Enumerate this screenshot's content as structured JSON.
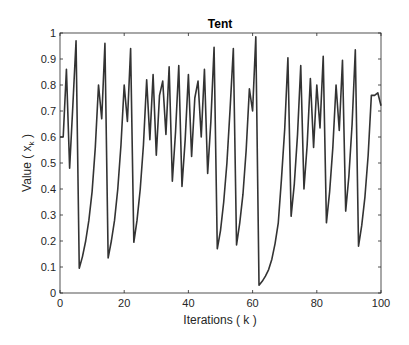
{
  "chart_data": {
    "type": "line",
    "title": "Tent",
    "xlabel": "Iterations ( k )",
    "ylabel_prefix": "Value ( x",
    "ylabel_subscript": "k",
    "ylabel_suffix": " )",
    "xlim": [
      0,
      100
    ],
    "ylim": [
      0,
      1
    ],
    "xticks": [
      0,
      20,
      40,
      60,
      80,
      100
    ],
    "yticks": [
      0,
      0.1,
      0.2,
      0.3,
      0.4,
      0.5,
      0.6,
      0.7,
      0.8,
      0.9,
      1
    ],
    "xtick_labels": [
      "0",
      "20",
      "40",
      "60",
      "80",
      "100"
    ],
    "ytick_labels": [
      "0",
      "0.1",
      "0.2",
      "0.3",
      "0.4",
      "0.5",
      "0.6",
      "0.7",
      "0.8",
      "0.9",
      "1"
    ],
    "grid": false,
    "legend": null,
    "line_color": "#333333",
    "series": [
      {
        "name": "Tent",
        "x": [
          0,
          1,
          2,
          3,
          4,
          5,
          6,
          7,
          8,
          9,
          10,
          11,
          12,
          13,
          14,
          15,
          16,
          17,
          18,
          19,
          20,
          21,
          22,
          23,
          24,
          25,
          26,
          27,
          28,
          29,
          30,
          31,
          32,
          33,
          34,
          35,
          36,
          37,
          38,
          39,
          40,
          41,
          42,
          43,
          44,
          45,
          46,
          47,
          48,
          49,
          50,
          51,
          52,
          53,
          54,
          55,
          56,
          57,
          58,
          59,
          60,
          61,
          62,
          63,
          64,
          65,
          66,
          67,
          68,
          69,
          70,
          71,
          72,
          73,
          74,
          75,
          76,
          77,
          78,
          79,
          80,
          81,
          82,
          83,
          84,
          85,
          86,
          87,
          88,
          89,
          90,
          91,
          92,
          93,
          94,
          95,
          96,
          97,
          98,
          99,
          100
        ],
        "values": [
          0.6,
          0.6,
          0.86,
          0.48,
          0.72,
          0.97,
          0.095,
          0.14,
          0.2,
          0.28,
          0.39,
          0.56,
          0.8,
          0.67,
          0.96,
          0.135,
          0.2,
          0.28,
          0.4,
          0.57,
          0.8,
          0.66,
          0.94,
          0.195,
          0.28,
          0.4,
          0.57,
          0.82,
          0.59,
          0.84,
          0.53,
          0.76,
          0.815,
          0.61,
          0.87,
          0.43,
          0.62,
          0.875,
          0.41,
          0.59,
          0.84,
          0.525,
          0.75,
          0.815,
          0.6,
          0.86,
          0.46,
          0.66,
          0.945,
          0.17,
          0.24,
          0.35,
          0.5,
          0.71,
          0.94,
          0.185,
          0.27,
          0.38,
          0.55,
          0.785,
          0.7,
          0.985,
          0.03,
          0.045,
          0.065,
          0.09,
          0.13,
          0.19,
          0.27,
          0.44,
          0.63,
          0.905,
          0.295,
          0.42,
          0.61,
          0.875,
          0.4,
          0.57,
          0.825,
          0.56,
          0.8,
          0.635,
          0.91,
          0.27,
          0.39,
          0.56,
          0.8,
          0.625,
          0.895,
          0.315,
          0.45,
          0.65,
          0.935,
          0.18,
          0.26,
          0.37,
          0.53,
          0.76,
          0.76,
          0.77,
          0.72
        ]
      }
    ]
  }
}
